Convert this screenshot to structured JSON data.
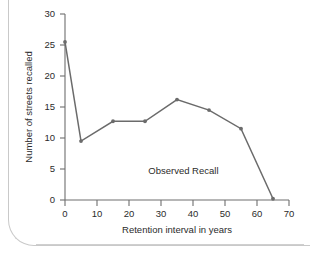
{
  "figure": {
    "annotation": "Observed Recall",
    "line_color": "#6b6b6b",
    "axis_color": "#6e6e6e",
    "text_color": "#2b2b2b",
    "background": "#ffffff"
  },
  "chart_data": {
    "type": "line",
    "title": "",
    "subtitle": "",
    "xlabel": "Retention interval in years",
    "ylabel": "Number of streets recalled",
    "xlim": [
      0,
      70
    ],
    "ylim": [
      0,
      30
    ],
    "xticks": [
      0,
      10,
      20,
      30,
      40,
      50,
      60,
      70
    ],
    "xtick_labels": [
      "0",
      "10",
      "20",
      "30",
      "40",
      "50",
      "60",
      "70"
    ],
    "yticks": [
      0,
      5,
      10,
      15,
      20,
      25,
      30
    ],
    "ytick_labels": [
      "0",
      "5",
      "10",
      "15",
      "20",
      "25",
      "30"
    ],
    "grid": false,
    "legend": null,
    "legend_position": "none",
    "annotations": [
      {
        "text": "Observed Recall",
        "x": 37,
        "y": 4.2
      }
    ],
    "series": [
      {
        "name": "Observed Recall",
        "color": "#6b6b6b",
        "marker": "circle",
        "x": [
          0,
          5,
          15,
          25,
          35,
          45,
          55,
          65
        ],
        "values": [
          25.5,
          9.5,
          12.7,
          12.7,
          16.2,
          14.5,
          11.5,
          0.2
        ]
      }
    ],
    "x": [
      0,
      5,
      15,
      25,
      35,
      45,
      55,
      65
    ],
    "values": [
      25.5,
      9.5,
      12.7,
      12.7,
      16.2,
      14.5,
      11.5,
      0.2
    ]
  }
}
